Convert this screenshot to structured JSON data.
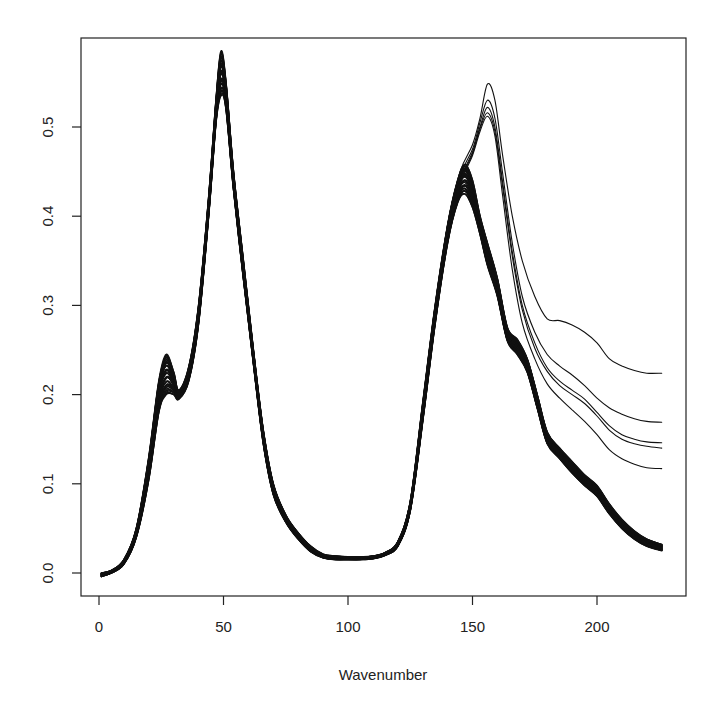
{
  "chart_data": {
    "type": "line",
    "title": "",
    "xlabel": "Wavenumber",
    "ylabel": "",
    "xlim": [
      0,
      230
    ],
    "ylim": [
      -0.02,
      0.6
    ],
    "x_ticks": [
      0,
      50,
      100,
      150,
      200
    ],
    "x_tick_labels": [
      "0",
      "50",
      "100",
      "150",
      "200"
    ],
    "y_ticks": [
      0.0,
      0.1,
      0.2,
      0.3,
      0.4,
      0.5
    ],
    "y_tick_labels": [
      "0.0",
      "0.1",
      "0.2",
      "0.3",
      "0.4",
      "0.5"
    ],
    "grid": false,
    "legend": null,
    "line_color": "#111111",
    "main_group": {
      "count": 30,
      "x": [
        1,
        5,
        10,
        15,
        20,
        24,
        27,
        30,
        32,
        36,
        40,
        44,
        47,
        49,
        51,
        54,
        58,
        62,
        66,
        70,
        75,
        80,
        85,
        90,
        95,
        100,
        105,
        110,
        115,
        120,
        125,
        130,
        135,
        140,
        144,
        147,
        150,
        153,
        156,
        160,
        164,
        168,
        172,
        176,
        180,
        185,
        190,
        195,
        200,
        205,
        210,
        215,
        220,
        226
      ],
      "y_upper": [
        0.0,
        0.003,
        0.015,
        0.05,
        0.13,
        0.215,
        0.245,
        0.225,
        0.205,
        0.23,
        0.3,
        0.42,
        0.53,
        0.585,
        0.55,
        0.45,
        0.35,
        0.25,
        0.16,
        0.1,
        0.065,
        0.045,
        0.03,
        0.021,
        0.019,
        0.018,
        0.018,
        0.019,
        0.023,
        0.035,
        0.08,
        0.19,
        0.3,
        0.39,
        0.44,
        0.458,
        0.44,
        0.4,
        0.37,
        0.33,
        0.275,
        0.262,
        0.24,
        0.2,
        0.158,
        0.14,
        0.125,
        0.11,
        0.098,
        0.077,
        0.06,
        0.047,
        0.038,
        0.032
      ],
      "y_lower": [
        -0.004,
        0.0,
        0.01,
        0.04,
        0.105,
        0.18,
        0.2,
        0.2,
        0.195,
        0.215,
        0.28,
        0.4,
        0.505,
        0.535,
        0.52,
        0.43,
        0.33,
        0.235,
        0.145,
        0.088,
        0.057,
        0.038,
        0.024,
        0.017,
        0.015,
        0.015,
        0.015,
        0.016,
        0.02,
        0.03,
        0.07,
        0.17,
        0.28,
        0.37,
        0.415,
        0.425,
        0.41,
        0.38,
        0.345,
        0.31,
        0.26,
        0.245,
        0.225,
        0.185,
        0.145,
        0.128,
        0.112,
        0.098,
        0.086,
        0.066,
        0.05,
        0.038,
        0.03,
        0.025
      ]
    },
    "outlier_series": [
      {
        "name": "outlier-1",
        "x": [
          140,
          145,
          150,
          153,
          156,
          159,
          162,
          166,
          170,
          175,
          180,
          185,
          190,
          195,
          200,
          205,
          210,
          215,
          220,
          226
        ],
        "y": [
          0.39,
          0.45,
          0.48,
          0.51,
          0.548,
          0.53,
          0.47,
          0.4,
          0.35,
          0.31,
          0.285,
          0.283,
          0.278,
          0.27,
          0.258,
          0.24,
          0.232,
          0.227,
          0.224,
          0.224
        ]
      },
      {
        "name": "outlier-2",
        "x": [
          140,
          145,
          150,
          153,
          156,
          159,
          162,
          166,
          170,
          175,
          180,
          185,
          190,
          195,
          200,
          205,
          210,
          215,
          220,
          226
        ],
        "y": [
          0.385,
          0.445,
          0.475,
          0.505,
          0.53,
          0.51,
          0.45,
          0.37,
          0.31,
          0.27,
          0.245,
          0.232,
          0.222,
          0.21,
          0.196,
          0.185,
          0.178,
          0.173,
          0.17,
          0.169
        ]
      },
      {
        "name": "outlier-3",
        "x": [
          140,
          145,
          150,
          153,
          156,
          159,
          162,
          166,
          170,
          175,
          180,
          185,
          190,
          195,
          200,
          205,
          210,
          215,
          220,
          226
        ],
        "y": [
          0.383,
          0.44,
          0.472,
          0.5,
          0.522,
          0.5,
          0.44,
          0.36,
          0.3,
          0.258,
          0.23,
          0.215,
          0.205,
          0.195,
          0.18,
          0.165,
          0.155,
          0.15,
          0.147,
          0.146
        ]
      },
      {
        "name": "outlier-4",
        "x": [
          140,
          145,
          150,
          153,
          156,
          159,
          162,
          166,
          170,
          175,
          180,
          185,
          190,
          195,
          200,
          205,
          210,
          215,
          220,
          226
        ],
        "y": [
          0.382,
          0.438,
          0.47,
          0.498,
          0.516,
          0.495,
          0.435,
          0.355,
          0.295,
          0.252,
          0.226,
          0.21,
          0.2,
          0.19,
          0.176,
          0.16,
          0.15,
          0.145,
          0.142,
          0.14
        ]
      },
      {
        "name": "outlier-5",
        "x": [
          140,
          145,
          150,
          153,
          156,
          159,
          162,
          166,
          170,
          175,
          180,
          185,
          190,
          195,
          200,
          205,
          210,
          215,
          220,
          226
        ],
        "y": [
          0.38,
          0.436,
          0.468,
          0.495,
          0.512,
          0.49,
          0.425,
          0.34,
          0.28,
          0.24,
          0.212,
          0.196,
          0.183,
          0.17,
          0.155,
          0.138,
          0.128,
          0.122,
          0.118,
          0.117
        ]
      }
    ]
  },
  "axes": {
    "x_title": "Wavenumber"
  }
}
